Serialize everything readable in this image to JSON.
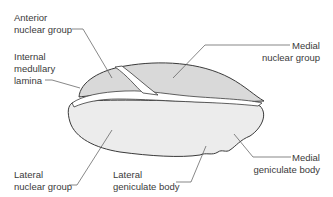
{
  "diagram": {
    "colors": {
      "outline": "#3a3a3a",
      "fill_upper": "#d9d9d9",
      "fill_lower": "#e9e9e9",
      "lamina": "#ffffff",
      "leader": "#555555",
      "text": "#3a3a3a"
    },
    "labels": [
      {
        "id": "anterior",
        "text": "Anterior\nnuclear group"
      },
      {
        "id": "internal",
        "text": "Internal\nmedullary\nlamina"
      },
      {
        "id": "medial_nuclear",
        "text": "Medial\nnuclear group"
      },
      {
        "id": "lateral_nuclear",
        "text": "Lateral\nnuclear group"
      },
      {
        "id": "lgb",
        "text": "Lateral\ngeniculate body"
      },
      {
        "id": "mgb",
        "text": "Medial\ngeniculate body"
      }
    ]
  }
}
